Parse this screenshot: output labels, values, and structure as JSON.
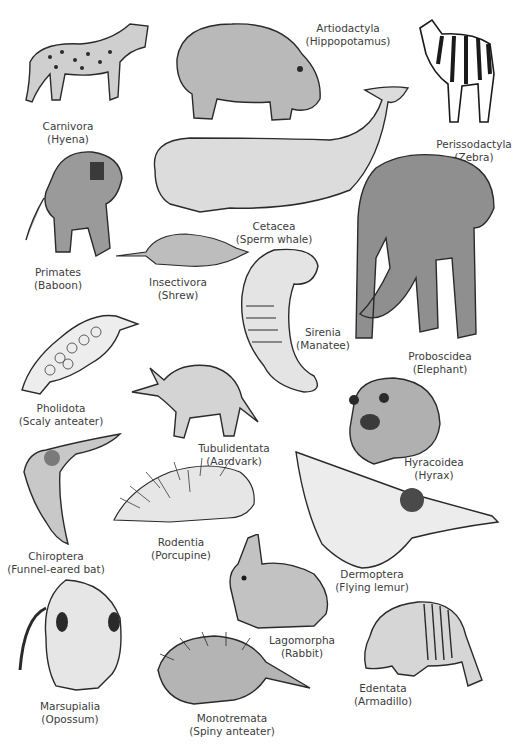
{
  "figure": {
    "animals": [
      {
        "order": "Carnivora",
        "common": "(Hyena)",
        "icon": "hyena-icon"
      },
      {
        "order": "Artiodactyla",
        "common": "(Hippopotamus)",
        "icon": "hippopotamus-icon"
      },
      {
        "order": "Perissodactyla",
        "common": "(Zebra)",
        "icon": "zebra-icon"
      },
      {
        "order": "Cetacea",
        "common": "(Sperm whale)",
        "icon": "sperm-whale-icon"
      },
      {
        "order": "Primates",
        "common": "(Baboon)",
        "icon": "baboon-icon"
      },
      {
        "order": "Insectivora",
        "common": "(Shrew)",
        "icon": "shrew-icon"
      },
      {
        "order": "Sirenia",
        "common": "(Manatee)",
        "icon": "manatee-icon"
      },
      {
        "order": "Proboscidea",
        "common": "(Elephant)",
        "icon": "elephant-icon"
      },
      {
        "order": "Pholidota",
        "common": "(Scaly anteater)",
        "icon": "pangolin-icon"
      },
      {
        "order": "Tubulidentata",
        "common": "(Aardvark)",
        "icon": "aardvark-icon"
      },
      {
        "order": "Hyracoidea",
        "common": "(Hyrax)",
        "icon": "hyrax-icon"
      },
      {
        "order": "Chiroptera",
        "common": "(Funnel-eared bat)",
        "icon": "bat-icon"
      },
      {
        "order": "Rodentia",
        "common": "(Porcupine)",
        "icon": "porcupine-icon"
      },
      {
        "order": "Dermoptera",
        "common": "(Flying lemur)",
        "icon": "flying-lemur-icon"
      },
      {
        "order": "Lagomorpha",
        "common": "(Rabbit)",
        "icon": "rabbit-icon"
      },
      {
        "order": "Marsupialia",
        "common": "(Opossum)",
        "icon": "opossum-icon"
      },
      {
        "order": "Edentata",
        "common": "(Armadillo)",
        "icon": "armadillo-icon"
      },
      {
        "order": "Monotremata",
        "common": "(Spiny anteater)",
        "icon": "spiny-anteater-icon"
      }
    ]
  },
  "colors": {
    "ink": "#2a2a2a",
    "shade": "#8a8a8a",
    "light": "#d8d8d8",
    "label": "#3c3c3c",
    "background": "#ffffff"
  }
}
